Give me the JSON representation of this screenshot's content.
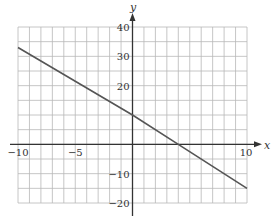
{
  "chart_data": {
    "type": "line",
    "title": "",
    "xlabel": "x",
    "ylabel": "y",
    "xlim": [
      -10,
      10
    ],
    "ylim": [
      -20,
      40
    ],
    "grid": true,
    "grid_x_step": 1,
    "grid_y_step": 5,
    "x_ticks": [
      -10,
      -5,
      10
    ],
    "x_tick_labels": [
      "−10",
      "−5",
      "10"
    ],
    "y_ticks": [
      40,
      30,
      20,
      -10,
      -20
    ],
    "y_tick_labels": [
      "40",
      "30",
      "20",
      "−10",
      "−20"
    ],
    "series": [
      {
        "name": "line",
        "equation": "y = -2.5x + 10",
        "x": [
          -10,
          0,
          4,
          10
        ],
        "y": [
          33,
          10,
          0,
          -15
        ]
      }
    ],
    "legend": null
  },
  "colors": {
    "grid": "#b8b8b8",
    "axis": "#333333",
    "line": "#555555",
    "background": "#ffffff"
  }
}
